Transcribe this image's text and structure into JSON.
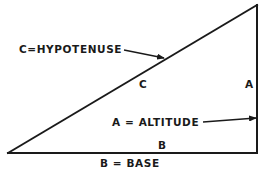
{
  "diagram": {
    "type": "right-triangle",
    "vertices": {
      "bottom_left": [
        8,
        153
      ],
      "bottom_right": [
        257,
        153
      ],
      "top_right": [
        257,
        5
      ]
    },
    "side_labels": {
      "hypotenuse": "C",
      "altitude": "A",
      "base": "B"
    },
    "callouts": {
      "hypotenuse": "C=HYPOTENUSE",
      "altitude": "A = ALTITUDE",
      "base": "B = BASE"
    },
    "colors": {
      "ink": "#1a1a1a",
      "background": "#ffffff"
    }
  }
}
